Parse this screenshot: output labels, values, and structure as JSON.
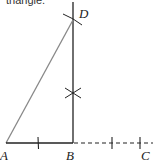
{
  "caption": "triangle.",
  "diagram": {
    "points": {
      "A": {
        "label": "A",
        "x": 6,
        "y": 143
      },
      "B": {
        "label": "B",
        "x": 73,
        "y": 143
      },
      "C": {
        "label": "C",
        "x": 145,
        "y": 143
      },
      "D": {
        "label": "D",
        "x": 73,
        "y": 20
      }
    },
    "segments": [
      {
        "from": "A",
        "to": "B",
        "style": "solid"
      },
      {
        "from": "B",
        "to": "D",
        "style": "solid"
      },
      {
        "from": "A",
        "to": "D",
        "style": "solid",
        "color": "#888888"
      },
      {
        "from": "B",
        "to": "C",
        "style": "dashed"
      }
    ],
    "colors": {
      "line": "#222222",
      "hypotenuse": "#888888"
    }
  }
}
